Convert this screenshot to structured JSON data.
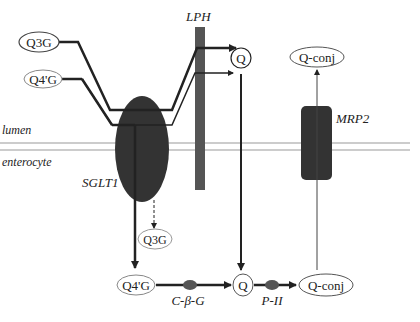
{
  "diagram": {
    "compartments": {
      "lumen": "lumen",
      "enterocyte": "enterocyte"
    },
    "transporters": {
      "lph": "LPH",
      "sglt1": "SGLT1",
      "mrp2": "MRP2"
    },
    "enzymes": {
      "cbg": "C-β-G",
      "p2": "P-II"
    },
    "nodes": {
      "lumen_q3g": "Q3G",
      "lumen_q4g": "Q4'G",
      "lumen_q": "Q",
      "lumen_qconj": "Q-conj",
      "cell_q3g": "Q3G",
      "cell_q4g": "Q4'G",
      "cell_q": "Q",
      "cell_qconj": "Q-conj"
    },
    "colors": {
      "dark_fill": "#333333",
      "lph_fill": "#555555",
      "enzyme_fill": "#555555",
      "membrane": "#999999",
      "line": "#222222"
    }
  }
}
